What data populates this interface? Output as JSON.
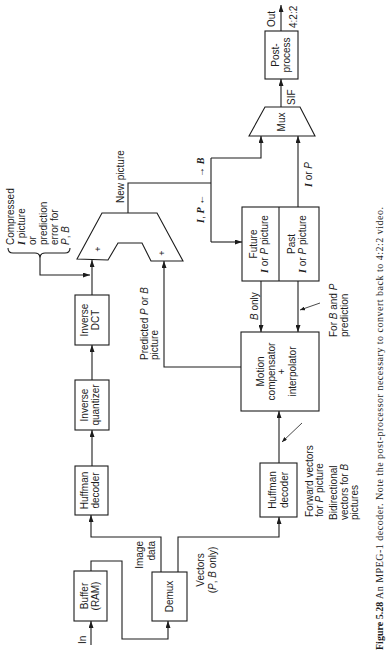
{
  "figure": {
    "number_label": "Figure 5.28",
    "caption": "An MPEG-1 decoder. Note the post-processor necessary to convert back to 4:2:2 video."
  },
  "blocks": {
    "buffer": {
      "line1": "Buffer",
      "line2": "(RAM)"
    },
    "demux": {
      "line1": "Demux"
    },
    "huffman_image": {
      "line1": "Huffman",
      "line2": "decoder"
    },
    "inverse_quantizer": {
      "line1": "Inverse",
      "line2": "quantizer"
    },
    "inverse_dct": {
      "line1": "Inverse",
      "line2": "DCT"
    },
    "adder": {
      "plus_left": "+",
      "plus_right": "+"
    },
    "huffman_vectors": {
      "line1": "Huffman",
      "line2": "decoder"
    },
    "motion_compensator": {
      "line1": "Motion",
      "line2": "compensator",
      "line3": "+",
      "line4": "interpolator"
    },
    "future_store": {
      "line1": "Future",
      "line2": [
        "I",
        " or ",
        "P",
        " picture"
      ]
    },
    "past_store": {
      "line1": "Past",
      "line2": [
        "I",
        " or ",
        "P",
        " picture"
      ]
    },
    "mux": {
      "line1": "Mux"
    },
    "postprocess": {
      "line1": "Post-",
      "line2": "process"
    }
  },
  "signals": {
    "input": "In",
    "image_data": {
      "line1": "Image",
      "line2": "data"
    },
    "vectors": {
      "line1": "Vectors",
      "line2": [
        "(",
        "P",
        ", ",
        "B",
        " only)"
      ]
    },
    "compressed": {
      "line1": "Compressed",
      "line2": [
        "I",
        " picture"
      ],
      "line3": "or",
      "line4": "prediction",
      "line5": "error for",
      "line6": [
        "P",
        ", ",
        "B"
      ]
    },
    "new_picture": "New picture",
    "reorder": {
      "left": [
        "I",
        ", ",
        "P",
        " ←"
      ],
      "right": [
        "→ ",
        "B"
      ]
    },
    "predicted": {
      "line1": [
        "Predicted ",
        "P",
        " or ",
        "B"
      ],
      "line2": "picture"
    },
    "b_only": [
      "B",
      " only"
    ],
    "for_b_and_p": {
      "line1": [
        "For ",
        "B",
        " and ",
        "P"
      ],
      "line2": "prediction"
    },
    "i_or_p": [
      "I",
      " or ",
      "P"
    ],
    "sif": "SIF",
    "output": "Out",
    "output_format": "4:2:2",
    "forward_vectors": {
      "line1": "Forward vectors",
      "line2": [
        "for ",
        "P",
        " picture"
      ]
    },
    "bidirectional_vectors": {
      "line1": "Bidirectional",
      "line2": [
        "vectors for ",
        "B"
      ],
      "line3": "pictures"
    }
  }
}
